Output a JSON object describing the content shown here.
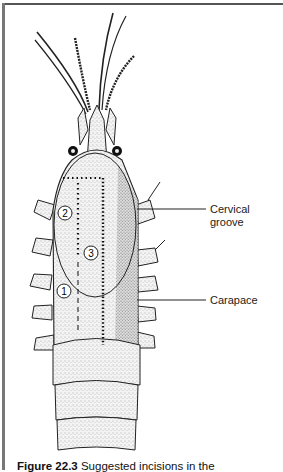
{
  "figure": {
    "labels": {
      "cervical_groove_line1": "Cervical",
      "cervical_groove_line2": "groove",
      "carapace": "Carapace"
    },
    "markers": [
      "1",
      "2",
      "3"
    ],
    "caption": {
      "number": "Figure 22.3",
      "text": "Suggested incisions in the"
    }
  }
}
